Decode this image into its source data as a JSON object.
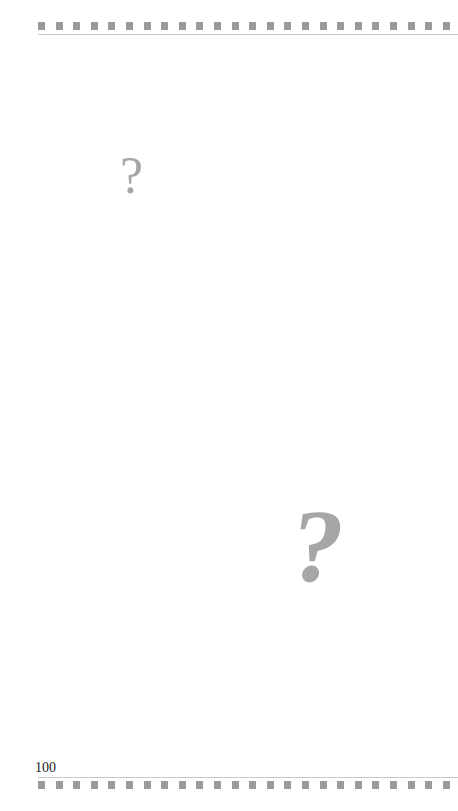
{
  "page": {
    "number": "100",
    "decoration": {
      "square_color": "#9a9a9a",
      "rule_color": "#c8c8c8",
      "squares_per_strip": 24
    },
    "question_marks": [
      {
        "glyph": "?",
        "color": "#a6a6a6",
        "size": "small"
      },
      {
        "glyph": "?",
        "color": "#a6a6a6",
        "size": "large"
      }
    ]
  }
}
